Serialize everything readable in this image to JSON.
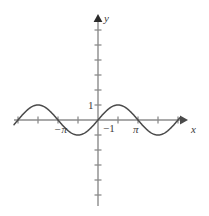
{
  "figure": {
    "name": "sine-curve-graph",
    "width": 209,
    "height": 216,
    "background": "#ffffff"
  },
  "colors": {
    "axis": "#8c8c8c",
    "curve": "#4a4a4a",
    "text": "#3a3a3a"
  },
  "axes": {
    "x_label": "x",
    "y_label": "y",
    "origin_px": {
      "x": 98,
      "y": 120
    },
    "unit_px": {
      "x_pi": 40,
      "y_one": 15
    },
    "x_axis_px": {
      "start": 14,
      "end": 186
    },
    "y_axis_px": {
      "top": 16,
      "bottom": 206
    },
    "x_tick_positions_px": [
      18,
      38,
      58,
      78,
      118,
      138,
      158,
      178
    ],
    "y_tick_positions_px": [
      30,
      45,
      60,
      75,
      90,
      105,
      135,
      150,
      165,
      180,
      195
    ],
    "arrow_x": true,
    "arrow_y": true
  },
  "tick_labels": {
    "one": "1",
    "negative_one": "−1",
    "negative_pi": "−π",
    "pi": "π"
  },
  "chart_data": {
    "type": "line",
    "title": "",
    "xlabel": "x",
    "ylabel": "y",
    "grid": false,
    "legend": null,
    "function": "y = sin(x)",
    "amplitude": 1,
    "period": "2π",
    "xlim": [
      -2.1,
      2.2
    ],
    "ylim": [
      -7,
      7
    ],
    "xlim_units": "multiples of π",
    "ylim_units": "units of 1",
    "x_tick_values": [
      "-2π",
      "-3π/2",
      "-π",
      "-π/2",
      "π/2",
      "π",
      "3π/2",
      "2π"
    ],
    "x_labeled_ticks": [
      {
        "value": "-π",
        "label": "−π"
      },
      {
        "value": "π",
        "label": "π"
      }
    ],
    "y_labeled_ticks": [
      {
        "value": 1,
        "label": "1"
      },
      {
        "value": -1,
        "label": "−1"
      }
    ],
    "key_points": [
      {
        "x": "-2π",
        "y": 0,
        "kind": "zero"
      },
      {
        "x": "-3π/2",
        "y": 1,
        "kind": "maximum"
      },
      {
        "x": "-π",
        "y": 0,
        "kind": "zero"
      },
      {
        "x": "-π/2",
        "y": -1,
        "kind": "minimum"
      },
      {
        "x": "0",
        "y": 0,
        "kind": "zero"
      },
      {
        "x": "π/2",
        "y": 1,
        "kind": "maximum"
      },
      {
        "x": "π",
        "y": 0,
        "kind": "zero"
      },
      {
        "x": "3π/2",
        "y": -1,
        "kind": "minimum"
      },
      {
        "x": "2π",
        "y": 0,
        "kind": "zero"
      }
    ]
  }
}
